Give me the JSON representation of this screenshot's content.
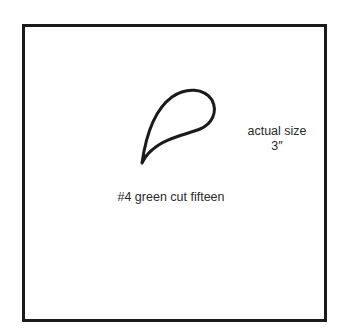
{
  "pattern": {
    "shape_name": "teardrop-petal",
    "size_label": "actual size",
    "size_value": "3″",
    "cut_label": "#4 green cut fifteen"
  },
  "colors": {
    "ink": "#1a1a1a",
    "background": "#ffffff"
  }
}
